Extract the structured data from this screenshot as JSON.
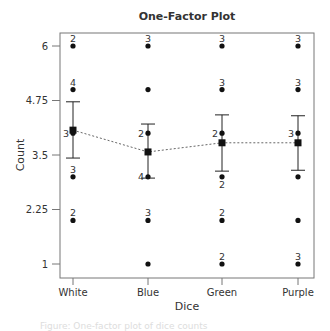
{
  "chart_data": {
    "type": "scatter",
    "title": "One-Factor Plot",
    "xlabel": "Dice",
    "ylabel": "Count",
    "categories": [
      "White",
      "Blue",
      "Green",
      "Purple"
    ],
    "yticks": [
      1,
      2.25,
      3.5,
      4.75,
      6
    ],
    "ytick_labels": [
      "1",
      "2.25",
      "3.5",
      "4.75",
      "6"
    ],
    "ylim": [
      0.7,
      6.3
    ],
    "grid": false,
    "legend": "none",
    "points": [
      {
        "category": "White",
        "values": [
          {
            "y": 6,
            "n": "2"
          },
          {
            "y": 5,
            "n": "4"
          },
          {
            "y": 4,
            "n": "3"
          },
          {
            "y": 3,
            "n": "3"
          },
          {
            "y": 2,
            "n": "2"
          }
        ]
      },
      {
        "category": "Blue",
        "values": [
          {
            "y": 6,
            "n": "3"
          },
          {
            "y": 5,
            "n": ""
          },
          {
            "y": 4,
            "n": "2"
          },
          {
            "y": 3,
            "n": "4"
          },
          {
            "y": 2,
            "n": "3"
          },
          {
            "y": 1,
            "n": ""
          }
        ]
      },
      {
        "category": "Green",
        "values": [
          {
            "y": 6,
            "n": "3"
          },
          {
            "y": 5,
            "n": "3"
          },
          {
            "y": 4,
            "n": "2"
          },
          {
            "y": 3,
            "n": "2"
          },
          {
            "y": 2,
            "n": "2"
          },
          {
            "y": 1,
            "n": "2"
          }
        ]
      },
      {
        "category": "Purple",
        "values": [
          {
            "y": 6,
            "n": "3"
          },
          {
            "y": 5,
            "n": "3"
          },
          {
            "y": 4,
            "n": "3"
          },
          {
            "y": 3,
            "n": ""
          },
          {
            "y": 2,
            "n": ""
          },
          {
            "y": 1,
            "n": "3"
          }
        ]
      }
    ],
    "series": [
      {
        "name": "Mean",
        "values": [
          4.07,
          3.57,
          3.78,
          3.78
        ]
      },
      {
        "name": "Upper error bar",
        "values": [
          4.72,
          4.21,
          4.42,
          4.4
        ]
      },
      {
        "name": "Lower error bar",
        "values": [
          3.43,
          2.97,
          3.13,
          3.15
        ]
      }
    ],
    "mean_line_style": "dotted"
  },
  "footer_text": "Figure: One-factor plot of dice counts"
}
